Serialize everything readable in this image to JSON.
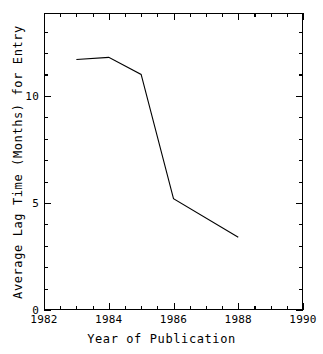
{
  "chart_data": {
    "type": "line",
    "title": "",
    "xlabel": "Year of Publication",
    "ylabel": "Average Lag Time (Months) for Entry",
    "xlim": [
      1982,
      1990
    ],
    "ylim": [
      0,
      13.87
    ],
    "grid": false,
    "legend": null,
    "x_major_ticks": [
      1982,
      1984,
      1986,
      1988,
      1990
    ],
    "x_major_tick_labels": [
      "1982",
      "1984",
      "1986",
      "1988",
      "1990"
    ],
    "x_minor_tick_interval": 0.5,
    "y_major_ticks": [
      0,
      5,
      10
    ],
    "y_major_tick_labels": [
      "0",
      "5",
      "10"
    ],
    "y_minor_tick_interval": 1,
    "x": [
      1983,
      1984,
      1985,
      1986,
      1988
    ],
    "values": [
      11.7,
      11.8,
      11.0,
      5.2,
      3.4
    ],
    "series": [
      {
        "name": "Average Lag Time",
        "x": [
          1983,
          1984,
          1985,
          1986,
          1988
        ],
        "values": [
          11.7,
          11.8,
          11.0,
          5.2,
          3.4
        ],
        "color": "#000000",
        "marker": "none",
        "linewidth": 1.1
      }
    ]
  },
  "axis": {
    "x_title": "Year of Publication",
    "y_title": "Average Lag Time (Months) for Entry",
    "x_tick_labels": [
      "1982",
      "1984",
      "1986",
      "1988",
      "1990"
    ],
    "y_tick_labels": [
      "10",
      "5",
      "0"
    ]
  }
}
